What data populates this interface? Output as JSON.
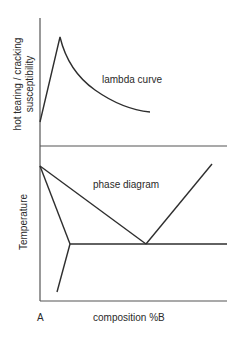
{
  "top_panel": {
    "ylabel_line1": "hot tearing / cracking",
    "ylabel_line2": "susceptibility",
    "annotation": "lambda curve"
  },
  "bottom_panel": {
    "ylabel": "Temperature",
    "annotation": "phase diagram",
    "xlabel": "composition %B",
    "origin_label": "A"
  },
  "colors": {
    "line": "#2e2e2e",
    "axis": "#555555",
    "text": "#2a2a2a",
    "background": "#ffffff"
  }
}
